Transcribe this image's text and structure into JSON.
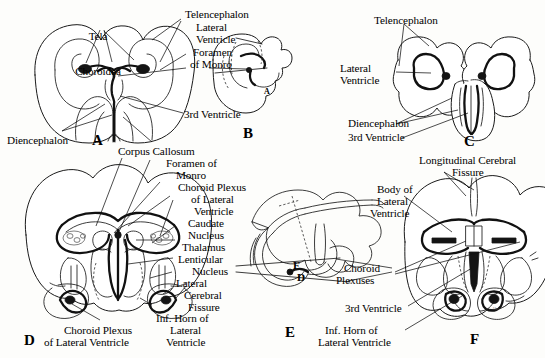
{
  "figure": {
    "signature": "Ales",
    "ink_color": "#111111",
    "paper_color": "#fdfdfb"
  },
  "panels": [
    {
      "id": "A",
      "letter": "A",
      "labels": [
        "Tela Choroidea",
        "Telencephalon",
        "Lateral Ventricle",
        "Foramen of Monro",
        "3rd Ventricle",
        "Diencephalon",
        "Corpus Callosum"
      ]
    },
    {
      "id": "B",
      "letter": "B",
      "labels": [
        "A"
      ]
    },
    {
      "id": "C",
      "letter": "C",
      "labels": [
        "Telencephalon",
        "Lateral Ventricle",
        "Diencephalon",
        "3rd Ventricle"
      ]
    },
    {
      "id": "D",
      "letter": "D",
      "labels": [
        "Corpus Callosum",
        "Foramen of Monro",
        "Choroid Plexus of Lateral Ventricle",
        "Caudate Nucleus",
        "Thalamus",
        "Lenticular Nucleus",
        "Lateral Cerebral Fissure",
        "Inf. Horn of Lateral Ventricle",
        "Choroid Plexus of Lateral Ventricle"
      ]
    },
    {
      "id": "E",
      "letter": "E",
      "labels": [
        "F",
        "D"
      ]
    },
    {
      "id": "F",
      "letter": "F",
      "labels": [
        "Longitudinal Cerebral Fissure",
        "Body of Lateral Ventricle",
        "Choroid Plexuses",
        "3rd Ventricle",
        "Inf. Horn of Lateral Ventricle"
      ]
    }
  ],
  "text": {
    "tela_choroidea_l1": "Tela",
    "tela_choroidea_l2": "Choroidea",
    "telencephalon_a": "Telencephalon",
    "lateral_a_l1": "Lateral",
    "lateral_a_l2": "Ventricle",
    "foramen_a_l1": "Foramen",
    "foramen_a_l2": "of Monro",
    "third_ventricle_a": "3rd Ventricle",
    "diencephalon_a": "Diencephalon",
    "corpus_callosum_d": "Corpus Callosum",
    "foramen_d_l1": "Foramen of",
    "foramen_d_l2": "Monro",
    "choroid_plexus_d_l1": "Choroid Plexus",
    "choroid_plexus_d_l2": "of Lateral",
    "choroid_plexus_d_l3": "Ventricle",
    "caudate_l1": "Caudate",
    "caudate_l2": "Nucleus",
    "thalamus": "Thalamus",
    "lenticular_l1": "Lenticular",
    "lenticular_l2": "Nucleus",
    "lateral_fissure_l1": "Lateral",
    "lateral_fissure_l2": "Cerebral",
    "lateral_fissure_l3": "Fissure",
    "inf_horn_d_l1": "Inf. Horn of",
    "inf_horn_d_l2": "Lateral",
    "inf_horn_d_l3": "Ventricle",
    "choroid_plexus_bottom_l1": "Choroid Plexus",
    "choroid_plexus_bottom_l2": "of Lateral Ventricle",
    "telencephalon_c": "Telencephalon",
    "lateral_c_l1": "Lateral",
    "lateral_c_l2": "Ventricle",
    "diencephalon_c": "Diencephalon",
    "third_ventricle_c": "3rd Ventricle",
    "long_fissure_l1": "Longitudinal Cerebral",
    "long_fissure_l2": "Fissure",
    "body_lat_l1": "Body of",
    "body_lat_l2": "Lateral",
    "body_lat_l3": "Ventricle",
    "choroid_plexuses_l1": "Choroid",
    "choroid_plexuses_l2": "Plexuses",
    "third_ventricle_f": "3rd Ventricle",
    "inf_horn_f_l1": "Inf. Horn of",
    "inf_horn_f_l2": "Lateral Ventricle",
    "marker_f": "F",
    "marker_d": "D",
    "marker_a_in_b": "A",
    "letter_a": "A",
    "letter_b": "B",
    "letter_c": "C",
    "letter_d": "D",
    "letter_e": "E",
    "letter_f": "F",
    "signature": "Ales"
  }
}
